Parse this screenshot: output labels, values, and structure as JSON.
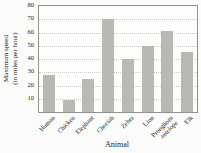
{
  "chart_data": {
    "type": "bar",
    "categories": [
      "Human",
      "Chicken",
      "Elephant",
      "Cheetah",
      "Zebra",
      "Lion",
      "Pronghorn\nantelope",
      "Elk"
    ],
    "values": [
      28,
      9,
      25,
      70,
      40,
      50,
      61,
      45
    ],
    "title": "",
    "xlabel": "Animal",
    "ylabel": "Maximum speed\n(in miles per hour)",
    "ylim": [
      0,
      80
    ],
    "yticks": [
      10,
      20,
      30,
      40,
      50,
      60,
      70,
      80
    ],
    "grid": true,
    "legend_position": "none",
    "colors": {
      "bar": "#b6b9b4",
      "gridline": "#c7cbc7",
      "axis_border": "#8f938f",
      "text": "#1c1c1c",
      "background": "#fbfbfa"
    }
  }
}
